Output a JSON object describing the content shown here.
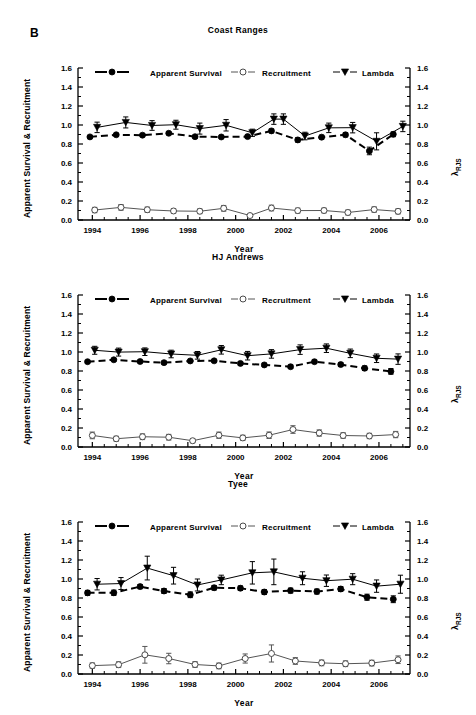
{
  "figure": {
    "panel_label": "B",
    "x_axis_label": "Year",
    "y_axis_left_label": "Apparent Survival & Recruitment",
    "y_axis_right_label_base": "λ",
    "y_axis_right_label_sub": "RJS",
    "y_ticks": [
      "0.0",
      "0.2",
      "0.4",
      "0.6",
      "0.8",
      "1.0",
      "1.2",
      "1.4",
      "1.6"
    ],
    "x_ticks": [
      "1994",
      "1996",
      "1998",
      "2000",
      "2002",
      "2004",
      "2006"
    ],
    "legend": [
      {
        "label": "Apparent Survival",
        "marker": "filled-circle",
        "line": "dashed",
        "color": "#000000"
      },
      {
        "label": "Recruitment",
        "marker": "open-circle",
        "line": "solid",
        "color": "#555555"
      },
      {
        "label": "Lambda",
        "marker": "filled-triangle-down",
        "line": "solid",
        "color": "#000000"
      }
    ]
  },
  "chart_data": [
    {
      "type": "line",
      "title": "Coast Ranges",
      "xlabel": "Year",
      "ylabel": "Apparent Survival & Recruitment",
      "ylabel_right": "λ RJS",
      "xlim": [
        1993.4,
        2007.3
      ],
      "ylim": [
        0.0,
        1.6
      ],
      "grid": false,
      "legend_position": "top",
      "x": [
        1994,
        1995,
        1996,
        1997,
        1998,
        1999,
        2000,
        2001,
        2002,
        2003,
        2004,
        2005,
        2006,
        2007
      ],
      "series": [
        {
          "name": "Apparent Survival",
          "x": [
            1993.9,
            1995.0,
            1996.1,
            1997.2,
            1998.3,
            1999.4,
            2000.5,
            2001.5,
            2002.6,
            2003.6,
            2004.6,
            2005.6,
            2006.6
          ],
          "values": [
            0.875,
            0.897,
            0.893,
            0.913,
            0.877,
            0.874,
            0.878,
            0.938,
            0.843,
            0.872,
            0.897,
            0.727,
            0.902
          ],
          "errors": [
            0.012,
            0.014,
            0.014,
            0.014,
            0.014,
            0.016,
            0.016,
            0.02,
            0.023,
            0.02,
            0.022,
            0.04,
            0.025
          ]
        },
        {
          "name": "Recruitment",
          "x": [
            1994.1,
            1995.2,
            1996.3,
            1997.4,
            1998.5,
            1999.5,
            2000.6,
            2001.5,
            2002.6,
            2003.7,
            2004.7,
            2005.8,
            2006.8
          ],
          "values": [
            0.105,
            0.133,
            0.108,
            0.095,
            0.092,
            0.123,
            0.047,
            0.126,
            0.099,
            0.1,
            0.079,
            0.11,
            0.091
          ],
          "errors": [
            0.028,
            0.03,
            0.028,
            0.025,
            0.025,
            0.03,
            0.012,
            0.03,
            0.026,
            0.025,
            0.026,
            0.028,
            0.027
          ]
        },
        {
          "name": "Lambda",
          "x": [
            1994.2,
            1995.4,
            1996.5,
            1997.5,
            1998.5,
            1999.6,
            2000.7,
            2001.6,
            2002.0,
            2002.9,
            2003.9,
            2004.9,
            2005.9,
            2007.0
          ],
          "values": [
            0.975,
            1.027,
            0.995,
            1.003,
            0.962,
            0.997,
            0.918,
            1.062,
            1.062,
            0.884,
            0.97,
            0.972,
            0.828,
            0.985
          ],
          "errors": [
            0.055,
            0.058,
            0.051,
            0.047,
            0.058,
            0.06,
            0.038,
            0.055,
            0.055,
            0.04,
            0.05,
            0.055,
            0.09,
            0.055
          ]
        }
      ]
    },
    {
      "type": "line",
      "title": "HJ Andrews",
      "xlabel": "Year",
      "ylabel": "Apparent Survival & Recruitment",
      "ylabel_right": "λ RJS",
      "xlim": [
        1993.4,
        2007.3
      ],
      "ylim": [
        0.0,
        1.6
      ],
      "grid": false,
      "legend_position": "top",
      "x": [
        1994,
        1995,
        1996,
        1997,
        1998,
        1999,
        2000,
        2001,
        2002,
        2003,
        2004,
        2005,
        2006,
        2007
      ],
      "series": [
        {
          "name": "Apparent Survival",
          "x": [
            1993.8,
            1994.9,
            1996.0,
            1997.0,
            1998.1,
            1999.1,
            2000.2,
            2001.2,
            2002.3,
            2003.3,
            2004.4,
            2005.4,
            2006.5
          ],
          "values": [
            0.898,
            0.918,
            0.9,
            0.888,
            0.906,
            0.907,
            0.88,
            0.864,
            0.845,
            0.898,
            0.868,
            0.829,
            0.796
          ],
          "errors": [
            0.012,
            0.013,
            0.013,
            0.014,
            0.014,
            0.014,
            0.016,
            0.017,
            0.019,
            0.018,
            0.02,
            0.024,
            0.03
          ]
        },
        {
          "name": "Recruitment",
          "x": [
            1994.0,
            1995.0,
            1996.1,
            1997.2,
            1998.2,
            1999.3,
            2000.3,
            2001.4,
            2002.4,
            2003.5,
            2004.5,
            2005.6,
            2006.7
          ],
          "values": [
            0.122,
            0.087,
            0.108,
            0.103,
            0.066,
            0.124,
            0.096,
            0.124,
            0.184,
            0.147,
            0.121,
            0.116,
            0.131
          ],
          "errors": [
            0.035,
            0.026,
            0.03,
            0.03,
            0.022,
            0.033,
            0.028,
            0.034,
            0.04,
            0.033,
            0.029,
            0.028,
            0.033
          ]
        },
        {
          "name": "Lambda",
          "x": [
            1994.1,
            1995.1,
            1996.2,
            1997.3,
            1998.4,
            1999.4,
            2000.5,
            2001.5,
            2002.7,
            2003.8,
            2004.8,
            2005.9,
            2006.8
          ],
          "values": [
            1.018,
            0.999,
            1.003,
            0.979,
            0.965,
            1.023,
            0.961,
            0.98,
            1.025,
            1.04,
            0.986,
            0.934,
            0.925
          ],
          "errors": [
            0.042,
            0.042,
            0.04,
            0.04,
            0.04,
            0.045,
            0.045,
            0.045,
            0.05,
            0.045,
            0.045,
            0.045,
            0.055
          ]
        }
      ]
    },
    {
      "type": "line",
      "title": "Tyee",
      "xlabel": "Year",
      "ylabel": "Apparent Survival & Recruitment",
      "ylabel_right": "λ RJS",
      "xlim": [
        1993.4,
        2007.3
      ],
      "ylim": [
        0.0,
        1.6
      ],
      "grid": false,
      "legend_position": "top",
      "x": [
        1994,
        1995,
        1996,
        1997,
        1998,
        1999,
        2000,
        2001,
        2002,
        2003,
        2004,
        2005,
        2006,
        2007
      ],
      "series": [
        {
          "name": "Apparent Survival",
          "x": [
            1993.8,
            1994.9,
            1996.0,
            1997.0,
            1998.1,
            1999.1,
            2000.2,
            2001.2,
            2002.3,
            2003.4,
            2004.4,
            2005.5,
            2006.6
          ],
          "values": [
            0.854,
            0.855,
            0.92,
            0.874,
            0.834,
            0.908,
            0.903,
            0.863,
            0.878,
            0.868,
            0.895,
            0.808,
            0.787
          ],
          "errors": [
            0.026,
            0.028,
            0.022,
            0.026,
            0.03,
            0.024,
            0.024,
            0.026,
            0.026,
            0.026,
            0.026,
            0.032,
            0.036
          ]
        },
        {
          "name": "Recruitment",
          "x": [
            1994.0,
            1995.1,
            1996.2,
            1997.2,
            1998.3,
            1999.3,
            2000.4,
            2001.5,
            2002.5,
            2003.6,
            2004.6,
            2005.7,
            2006.8
          ],
          "values": [
            0.088,
            0.098,
            0.202,
            0.163,
            0.1,
            0.085,
            0.163,
            0.216,
            0.137,
            0.117,
            0.108,
            0.115,
            0.15
          ],
          "errors": [
            0.028,
            0.03,
            0.088,
            0.055,
            0.03,
            0.03,
            0.048,
            0.09,
            0.035,
            0.03,
            0.03,
            0.03,
            0.04
          ]
        },
        {
          "name": "Lambda",
          "x": [
            1994.2,
            1995.2,
            1996.3,
            1997.4,
            1998.4,
            1999.4,
            2000.7,
            2001.6,
            2002.8,
            2003.8,
            2004.9,
            2005.9,
            2006.9
          ],
          "values": [
            0.945,
            0.952,
            1.115,
            1.035,
            0.937,
            0.99,
            1.065,
            1.075,
            1.008,
            0.982,
            0.998,
            0.925,
            0.945
          ],
          "errors": [
            0.06,
            0.063,
            0.125,
            0.088,
            0.063,
            0.05,
            0.118,
            0.135,
            0.068,
            0.06,
            0.058,
            0.065,
            0.095
          ]
        }
      ]
    }
  ]
}
